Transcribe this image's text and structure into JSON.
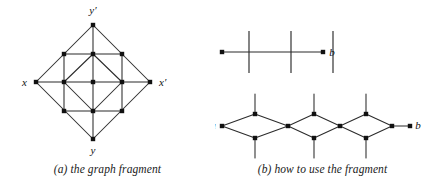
{
  "figure": {
    "width": 430,
    "height": 191,
    "background": "#ffffff",
    "ink": "#2b2b2b",
    "node_fill": "#111111"
  },
  "panel_a": {
    "caption": "(a) the graph fragment",
    "labels": {
      "top": "y′",
      "left": "x",
      "right": "x′",
      "bottom": "y"
    },
    "label_positions": [
      {
        "name": "label-y-prime",
        "text": "y′",
        "x": 93,
        "y": 14,
        "anchor": "middle"
      },
      {
        "name": "label-x",
        "text": "x",
        "x": 27,
        "y": 86,
        "anchor": "end"
      },
      {
        "name": "label-x-prime",
        "text": "x′",
        "x": 159,
        "y": 86,
        "anchor": "start"
      },
      {
        "name": "label-y",
        "text": "y",
        "x": 93,
        "y": 154,
        "anchor": "middle"
      }
    ],
    "nodes": [
      {
        "id": "yp",
        "x": 93,
        "y": 25,
        "role": "outer-top"
      },
      {
        "id": "x",
        "x": 36,
        "y": 82,
        "role": "outer-left"
      },
      {
        "id": "xp",
        "x": 150,
        "y": 82,
        "role": "outer-right"
      },
      {
        "id": "y",
        "x": 93,
        "y": 139,
        "role": "outer-bottom"
      },
      {
        "id": "nw",
        "x": 64,
        "y": 54,
        "role": "mid-upper-left"
      },
      {
        "id": "ne",
        "x": 122,
        "y": 54,
        "role": "mid-upper-right"
      },
      {
        "id": "sw",
        "x": 64,
        "y": 111,
        "role": "mid-lower-left"
      },
      {
        "id": "se",
        "x": 122,
        "y": 111,
        "role": "mid-lower-right"
      },
      {
        "id": "it",
        "x": 93,
        "y": 54,
        "role": "inner-top"
      },
      {
        "id": "il",
        "x": 64,
        "y": 82,
        "role": "inner-left"
      },
      {
        "id": "ir",
        "x": 122,
        "y": 82,
        "role": "inner-right"
      },
      {
        "id": "ib",
        "x": 93,
        "y": 111,
        "role": "inner-bottom"
      },
      {
        "id": "c",
        "x": 93,
        "y": 82,
        "role": "center"
      }
    ],
    "edges": [
      [
        "yp",
        "x"
      ],
      [
        "yp",
        "xp"
      ],
      [
        "y",
        "x"
      ],
      [
        "y",
        "xp"
      ],
      [
        "x",
        "il"
      ],
      [
        "il",
        "c"
      ],
      [
        "c",
        "ir"
      ],
      [
        "ir",
        "xp"
      ],
      [
        "yp",
        "it"
      ],
      [
        "it",
        "c"
      ],
      [
        "c",
        "ib"
      ],
      [
        "ib",
        "y"
      ],
      [
        "nw",
        "it"
      ],
      [
        "it",
        "ne"
      ],
      [
        "sw",
        "ib"
      ],
      [
        "ib",
        "se"
      ],
      [
        "nw",
        "il"
      ],
      [
        "il",
        "sw"
      ],
      [
        "ne",
        "ir"
      ],
      [
        "ir",
        "se"
      ],
      [
        "il",
        "it"
      ],
      [
        "it",
        "ir"
      ],
      [
        "ir",
        "ib"
      ],
      [
        "ib",
        "il"
      ]
    ]
  },
  "panel_b": {
    "caption": "(b) how to use the fragment",
    "top_diagram": {
      "name": "line-with-crossings",
      "endpoints": {
        "a": "a",
        "b": "b"
      },
      "line": {
        "x1": 222,
        "y1": 52,
        "x2": 323,
        "y2": 52
      },
      "label_a": {
        "text": "a",
        "x": 211,
        "y": 56
      },
      "label_b": {
        "text": "b",
        "x": 332,
        "y": 56
      },
      "node_a": {
        "x": 222,
        "y": 52
      },
      "node_b": {
        "x": 323,
        "y": 52
      },
      "crossings": [
        {
          "x": 249,
          "y1": 31,
          "y2": 73
        },
        {
          "x": 291,
          "y1": 31,
          "y2": 73
        },
        {
          "x": 333,
          "y1": 31,
          "y2": 73
        }
      ]
    },
    "bottom_diagram": {
      "name": "diamond-chain",
      "endpoints": {
        "a": "a",
        "b": "b"
      },
      "label_a": {
        "text": "a",
        "x": 213,
        "y": 129
      },
      "label_b": {
        "text": "b",
        "x": 418,
        "y": 129
      },
      "nodes": [
        {
          "id": "a",
          "x": 222,
          "y": 126,
          "role": "terminal-left"
        },
        {
          "id": "t1",
          "x": 255,
          "y": 114,
          "role": "diamond-top"
        },
        {
          "id": "b1",
          "x": 255,
          "y": 138,
          "role": "diamond-bottom"
        },
        {
          "id": "j1",
          "x": 288,
          "y": 126,
          "role": "junction"
        },
        {
          "id": "t2",
          "x": 314,
          "y": 114,
          "role": "diamond-top"
        },
        {
          "id": "b2",
          "x": 314,
          "y": 138,
          "role": "diamond-bottom"
        },
        {
          "id": "j2",
          "x": 340,
          "y": 126,
          "role": "junction"
        },
        {
          "id": "t3",
          "x": 366,
          "y": 114,
          "role": "diamond-top"
        },
        {
          "id": "b3",
          "x": 366,
          "y": 138,
          "role": "diamond-bottom"
        },
        {
          "id": "j3",
          "x": 392,
          "y": 126,
          "role": "junction"
        },
        {
          "id": "b",
          "x": 410,
          "y": 126,
          "role": "terminal-right"
        }
      ],
      "edges": [
        [
          "a",
          "t1"
        ],
        [
          "a",
          "b1"
        ],
        [
          "t1",
          "j1"
        ],
        [
          "b1",
          "j1"
        ],
        [
          "j1",
          "t2"
        ],
        [
          "j1",
          "b2"
        ],
        [
          "t2",
          "j2"
        ],
        [
          "b2",
          "j2"
        ],
        [
          "j2",
          "t3"
        ],
        [
          "j2",
          "b3"
        ],
        [
          "t3",
          "j3"
        ],
        [
          "b3",
          "j3"
        ],
        [
          "j3",
          "b"
        ]
      ],
      "stubs": [
        {
          "x": 255,
          "y1": 94,
          "y2": 114
        },
        {
          "x": 255,
          "y1": 138,
          "y2": 158
        },
        {
          "x": 314,
          "y1": 94,
          "y2": 114
        },
        {
          "x": 314,
          "y1": 138,
          "y2": 158
        },
        {
          "x": 366,
          "y1": 94,
          "y2": 114
        },
        {
          "x": 366,
          "y1": 138,
          "y2": 158
        }
      ]
    }
  }
}
